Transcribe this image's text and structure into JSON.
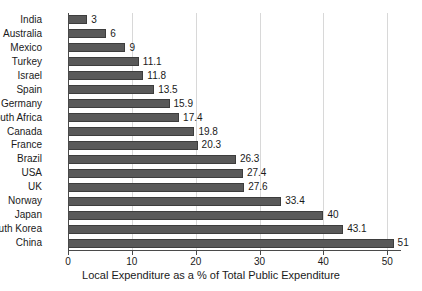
{
  "chart_data": {
    "type": "bar",
    "orientation": "horizontal",
    "title": "",
    "xlabel": "Local Expenditure as a % of Total Public Expenditure",
    "ylabel": "",
    "xlim": [
      0,
      52
    ],
    "xticks": [
      0,
      10,
      20,
      30,
      40,
      50
    ],
    "xtick_labels": [
      "0",
      "10",
      "20",
      "30",
      "40",
      "50"
    ],
    "grid": "vertical",
    "legend": "none",
    "bar_color": "#595959",
    "bar_edge_color": "#3d3d3d",
    "categories": [
      "India",
      "Australia",
      "Mexico",
      "Turkey",
      "Israel",
      "Spain",
      "Germany",
      "South Africa",
      "Canada",
      "France",
      "Brazil",
      "USA",
      "UK",
      "Norway",
      "Japan",
      "South Korea",
      "China"
    ],
    "values": [
      3,
      6,
      9,
      11.1,
      11.8,
      13.5,
      15.9,
      17.4,
      19.8,
      20.3,
      26.3,
      27.4,
      27.6,
      33.4,
      40,
      43.1,
      51
    ],
    "value_labels": [
      "3",
      "6",
      "9",
      "11.1",
      "11.8",
      "13.5",
      "15.9",
      "17.4",
      "19.8",
      "20.3",
      "26.3",
      "27.4",
      "27.6",
      "33.4",
      "40",
      "43.1",
      "51"
    ]
  }
}
